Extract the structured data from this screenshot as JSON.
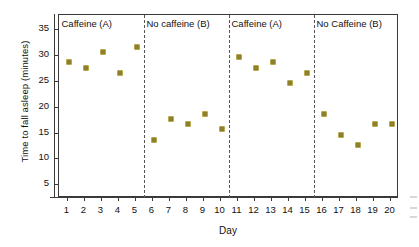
{
  "chart_data": {
    "type": "scatter",
    "title": "",
    "xlabel": "Day",
    "ylabel": "Time to fall asleep (minutes)",
    "x": [
      1,
      2,
      3,
      4,
      5,
      6,
      7,
      8,
      9,
      10,
      11,
      12,
      13,
      14,
      15,
      16,
      17,
      18,
      19,
      20
    ],
    "values": [
      29,
      28,
      31,
      27,
      32,
      14,
      18,
      17,
      19,
      16,
      30,
      28,
      29,
      25,
      27,
      19,
      15,
      13,
      17,
      17
    ],
    "series": [
      {
        "name": "Time to fall asleep",
        "values": [
          29,
          28,
          31,
          27,
          32,
          14,
          18,
          17,
          19,
          16,
          30,
          28,
          29,
          25,
          27,
          19,
          15,
          13,
          17,
          17
        ]
      }
    ],
    "xtick_labels": [
      "1",
      "2",
      "3",
      "4",
      "5",
      "6",
      "7",
      "8",
      "9",
      "10",
      "11",
      "12",
      "13",
      "14",
      "15",
      "16",
      "17",
      "18",
      "19",
      "20"
    ],
    "ytick_labels": [
      "5",
      "10",
      "15",
      "20",
      "25",
      "30",
      "35"
    ],
    "ytick_values": [
      5,
      10,
      15,
      20,
      25,
      30,
      35
    ],
    "ylim": [
      2.5,
      38
    ],
    "xlim": [
      0.5,
      20.5
    ],
    "grid": false,
    "legend": "none",
    "marker_color": "#8d7f2c",
    "marker_edge_color": "#b6a84e",
    "axis_color": "#3a3a3a",
    "divider_color": "#555555",
    "divider_positions": [
      5.5,
      10.5,
      15.5
    ],
    "panels": [
      {
        "label": "Caffeine (A)",
        "start_day": 1,
        "end_day": 5
      },
      {
        "label": "No caffeine (B)",
        "start_day": 6,
        "end_day": 10
      },
      {
        "label": "Caffeine (A)",
        "start_day": 11,
        "end_day": 15
      },
      {
        "label": "No Caffeine (B)",
        "start_day": 16,
        "end_day": 20
      }
    ],
    "annotations": []
  }
}
